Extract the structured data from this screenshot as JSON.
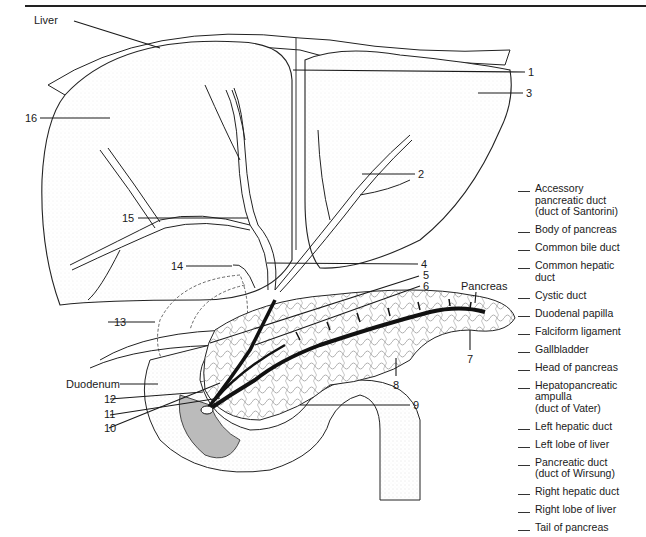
{
  "figure": {
    "callouts": {
      "liver": "Liver",
      "pancreas": "Pancreas",
      "duodenum": "Duodenum",
      "n1": "1",
      "n2": "2",
      "n3": "3",
      "n4": "4",
      "n5": "5",
      "n6": "6",
      "n7": "7",
      "n8": "8",
      "n9": "9",
      "n10": "10",
      "n11": "11",
      "n12": "12",
      "n13": "13",
      "n14": "14",
      "n15": "15",
      "n16": "16"
    },
    "colors": {
      "ink": "#1a1a1a",
      "duct": "#111111",
      "stipple": "#9a9a9a",
      "paper": "#ffffff"
    }
  },
  "legend": {
    "items": [
      "Accessory\npancreatic duct\n(duct of Santorini)",
      "Body of pancreas",
      "Common bile duct",
      "Common hepatic\nduct",
      "Cystic duct",
      "Duodenal papilla",
      "Falciform ligament",
      "Gallbladder",
      "Head of pancreas",
      "Hepatopancreatic\nampulla\n(duct of Vater)",
      "Left hepatic duct",
      "Left lobe of liver",
      "Pancreatic duct\n(duct of Wirsung)",
      "Right hepatic duct",
      "Right lobe of liver",
      "Tail of pancreas"
    ]
  }
}
